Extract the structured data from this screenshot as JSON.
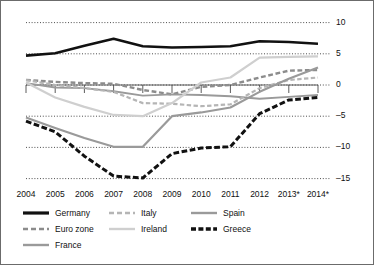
{
  "chart_data": {
    "type": "line",
    "title": "",
    "subtitle": "",
    "xlabel": "",
    "ylabel": "",
    "x": [
      "2004",
      "2005",
      "2006",
      "2007",
      "2008",
      "2009",
      "2010",
      "2011",
      "2012",
      "2013*",
      "2014*"
    ],
    "xtick_labels": [
      "2004",
      "2005",
      "2006",
      "2007",
      "2008",
      "2009",
      "2010",
      "2011",
      "2012",
      "2013*",
      "2014*"
    ],
    "ytick_labels": [
      "10",
      "5",
      "0",
      "-5",
      "-10",
      "-15"
    ],
    "ytick_values": [
      10,
      5,
      0,
      -5,
      -10,
      -15
    ],
    "ylim": [
      -16.5,
      11.5
    ],
    "grid": "horizontal-dotted",
    "legend_position": "bottom-left",
    "zero_axis": true,
    "series": [
      {
        "name": "Germany",
        "color": "#111111",
        "width": 2.6,
        "dash": "none",
        "values": [
          4.7,
          5.1,
          6.3,
          7.4,
          6.2,
          6.0,
          6.1,
          6.2,
          7.0,
          6.9,
          6.6
        ]
      },
      {
        "name": "Euro zone",
        "color": "#8c8c8c",
        "width": 2.4,
        "dash": "dashed",
        "values": [
          0.8,
          0.5,
          0.3,
          0.2,
          -0.8,
          -1.5,
          -0.3,
          0.0,
          1.2,
          2.3,
          2.4
        ]
      },
      {
        "name": "France",
        "color": "#9a9a9a",
        "width": 1.9,
        "dash": "none",
        "values": [
          0.3,
          -0.4,
          -0.5,
          -1.0,
          -1.7,
          -1.5,
          -1.6,
          -1.8,
          -2.2,
          -1.9,
          -1.6
        ]
      },
      {
        "name": "Italy",
        "color": "#b5b5b5",
        "width": 2.2,
        "dash": "dashed",
        "values": [
          0.8,
          0.0,
          -0.5,
          -1.1,
          -2.9,
          -3.0,
          -3.4,
          -3.1,
          -0.5,
          0.8,
          1.2
        ]
      },
      {
        "name": "Ireland",
        "color": "#cfcfcf",
        "width": 2.2,
        "dash": "none",
        "values": [
          0.4,
          -2.0,
          -3.5,
          -4.8,
          -5.0,
          -2.9,
          0.4,
          1.2,
          4.4,
          4.5,
          4.6
        ]
      },
      {
        "name": "Spain",
        "color": "#9a9a9a",
        "width": 2.2,
        "dash": "none",
        "values": [
          -5.2,
          -6.9,
          -8.5,
          -9.9,
          -9.9,
          -5.0,
          -4.4,
          -3.6,
          -1.1,
          1.0,
          2.8
        ]
      },
      {
        "name": "Greece",
        "color": "#111111",
        "width": 3.0,
        "dash": "thick-dashed",
        "values": [
          -5.8,
          -7.5,
          -11.4,
          -14.6,
          -14.9,
          -11.0,
          -10.1,
          -9.9,
          -4.6,
          -2.4,
          -2.0
        ]
      }
    ],
    "legend": [
      {
        "label": "Germany",
        "color": "#111111",
        "style": "solid-thick"
      },
      {
        "label": "Euro zone",
        "color": "#8c8c8c",
        "style": "dashed"
      },
      {
        "label": "France",
        "color": "#9a9a9a",
        "style": "solid"
      },
      {
        "label": "Italy",
        "color": "#b5b5b5",
        "style": "dashed"
      },
      {
        "label": "Ireland",
        "color": "#cfcfcf",
        "style": "solid"
      },
      {
        "label": "Spain",
        "color": "#9a9a9a",
        "style": "solid"
      },
      {
        "label": "Greece",
        "color": "#111111",
        "style": "thick-dashed"
      }
    ]
  }
}
